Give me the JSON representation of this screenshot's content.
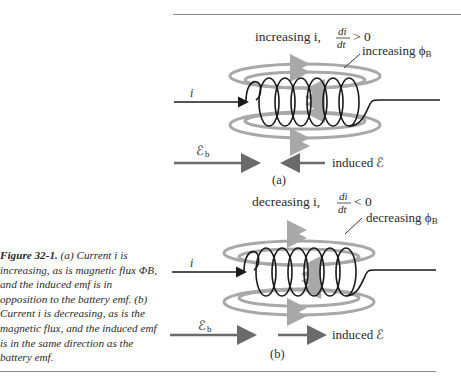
{
  "figure": {
    "number_label": "Figure 32-1.",
    "caption": "(a) Current i is increasing, as is magnetic flux ΦB, and the induced emf is in opposition to the battery emf. (b) Current i is decreasing, as is the magnetic flux, and the induced emf is in the same direction as the battery emf."
  },
  "panel_a": {
    "title_prefix": "increasing i,",
    "derivative_num": "di",
    "derivative_den": "dt",
    "derivative_rel": "> 0",
    "flux_label": "increasing ϕ",
    "flux_sub": "B",
    "current_label": "i",
    "battery_emf": "ℰ",
    "battery_emf_sub": "b",
    "induced_label": "induced ℰ",
    "panel_label": "(a)"
  },
  "panel_b": {
    "title_prefix": "decreasing i,",
    "derivative_num": "di",
    "derivative_den": "dt",
    "derivative_rel": "< 0",
    "flux_label": "decreasing ϕ",
    "flux_sub": "B",
    "current_label": "i",
    "battery_emf": "ℰ",
    "battery_emf_sub": "b",
    "induced_label": "induced ℰ",
    "panel_label": "(b)"
  },
  "colors": {
    "field_lines": "#a8a8a8",
    "arrows": "#6a6a6a",
    "wire": "#1a1a1a"
  }
}
